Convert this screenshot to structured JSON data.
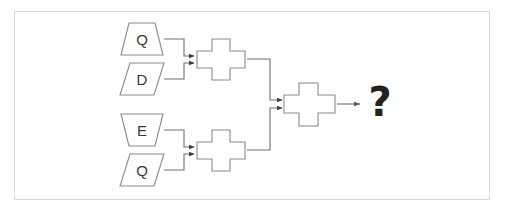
{
  "canvas": {
    "width": 505,
    "height": 209,
    "background": "#ffffff",
    "border_color": "#d6d6d6"
  },
  "style": {
    "shape_stroke": "#8a8a8a",
    "shape_fill": "#ffffff",
    "connector_stroke": "#6e6e6e",
    "label_color": "#3a3a3a",
    "question_color": "#222222"
  },
  "diagram": {
    "type": "flowchart",
    "title": "",
    "inputs": [
      {
        "id": "in1",
        "label": "Q",
        "shape": "trapezoid"
      },
      {
        "id": "in2",
        "label": "D",
        "shape": "parallelogram"
      },
      {
        "id": "in3",
        "label": "E",
        "shape": "inverted-trapezoid"
      },
      {
        "id": "in4",
        "label": "Q",
        "shape": "parallelogram"
      }
    ],
    "operators": [
      {
        "id": "op-top",
        "shape": "cross",
        "label": ""
      },
      {
        "id": "op-bottom",
        "shape": "cross",
        "label": ""
      },
      {
        "id": "op-final",
        "shape": "cross",
        "label": ""
      }
    ],
    "output": {
      "id": "out",
      "label": "?"
    },
    "edges": [
      {
        "from": "in1",
        "to": "op-top"
      },
      {
        "from": "in2",
        "to": "op-top"
      },
      {
        "from": "in3",
        "to": "op-bottom"
      },
      {
        "from": "in4",
        "to": "op-bottom"
      },
      {
        "from": "op-top",
        "to": "op-final"
      },
      {
        "from": "op-bottom",
        "to": "op-final"
      },
      {
        "from": "op-final",
        "to": "out"
      }
    ]
  }
}
